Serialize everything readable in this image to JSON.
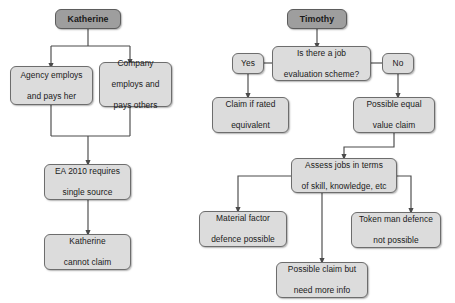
{
  "diagram": {
    "colors": {
      "node_fill": "#dcdcdc",
      "header_fill": "#9e9e9e",
      "node_border": "#6d6d6d",
      "edge": "#4a4a4a",
      "background": "#ffffff",
      "text": "#1a1a1a"
    },
    "flows": [
      {
        "name": "katherine-flow",
        "root": "Katherine",
        "nodes": [
          {
            "id": "katherine-root",
            "label": "Katherine",
            "type": "header"
          },
          {
            "id": "agency-employs",
            "label": "Agency employs and pays her",
            "type": "process"
          },
          {
            "id": "company-employs",
            "label": "Company employs and pays others",
            "type": "process"
          },
          {
            "id": "ea-2010",
            "label": "EA 2010 requires single source",
            "type": "process"
          },
          {
            "id": "katherine-cannot-claim",
            "label": "Katherine cannot claim",
            "type": "process"
          }
        ]
      },
      {
        "name": "timothy-flow",
        "root": "Timothy",
        "nodes": [
          {
            "id": "timothy-root",
            "label": "Timothy",
            "type": "header"
          },
          {
            "id": "job-evaluation-scheme",
            "label": "Is there a job evaluation scheme?",
            "type": "decision"
          },
          {
            "id": "branch-yes",
            "label": "Yes",
            "type": "branch-label"
          },
          {
            "id": "branch-no",
            "label": "No",
            "type": "branch-label"
          },
          {
            "id": "claim-if-rated-equivalent",
            "label": "Claim if rated equivalent",
            "type": "process"
          },
          {
            "id": "possible-equal-value-claim",
            "label": "Possible equal value claim",
            "type": "process"
          },
          {
            "id": "assess-jobs",
            "label": "Assess jobs in terms of skill, knowledge, etc",
            "type": "process"
          },
          {
            "id": "material-factor-defence",
            "label": "Material factor defence possible",
            "type": "process"
          },
          {
            "id": "possible-claim-more-info",
            "label": "Possible claim but need more info",
            "type": "process"
          },
          {
            "id": "token-man-defence",
            "label": "Token man defence not possible",
            "type": "process"
          }
        ]
      }
    ],
    "labels": {
      "katherine_root": "Katherine",
      "agency_employs_line1": "Agency employs",
      "agency_employs_line2": "and pays her",
      "company_employs_line1": "Company",
      "company_employs_line2": "employs and",
      "company_employs_line3": "pays others",
      "ea_2010_line1": "EA 2010 requires",
      "ea_2010_line2": "single source",
      "katherine_cannot_line1": "Katherine",
      "katherine_cannot_line2": "cannot claim",
      "timothy_root": "Timothy",
      "job_eval_line1": "Is there a job",
      "job_eval_line2": "evaluation scheme?",
      "yes": "Yes",
      "no": "No",
      "claim_rated_line1": "Claim if rated",
      "claim_rated_line2": "equivalent",
      "possible_equal_line1": "Possible equal",
      "possible_equal_line2": "value claim",
      "assess_jobs_line1": "Assess jobs in terms",
      "assess_jobs_line2": "of skill, knowledge, etc",
      "material_factor_line1": "Material factor",
      "material_factor_line2": "defence possible",
      "possible_claim_line1": "Possible claim but",
      "possible_claim_line2": "need more info",
      "token_man_line1": "Token man defence",
      "token_man_line2": "not possible"
    }
  }
}
